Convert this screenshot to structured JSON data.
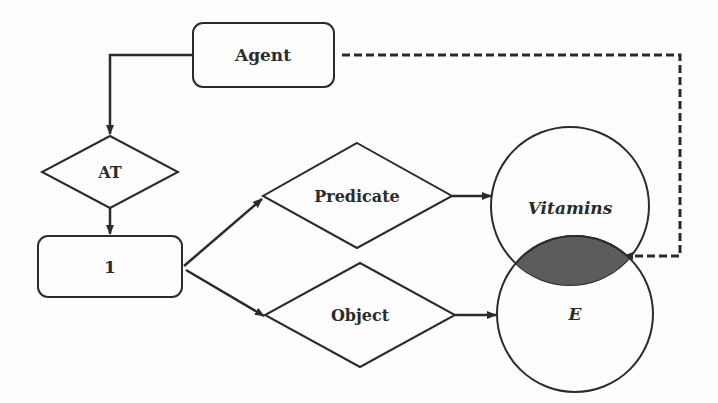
{
  "diagram": {
    "nodes": {
      "agent": {
        "label": "Agent",
        "shape": "rounded-rect"
      },
      "at": {
        "label": "AT",
        "shape": "diamond"
      },
      "one": {
        "label": "1",
        "shape": "rounded-rect"
      },
      "predicate": {
        "label": "Predicate",
        "shape": "diamond"
      },
      "object": {
        "label": "Object",
        "shape": "diamond"
      },
      "vitamins": {
        "label": "Vitamins",
        "shape": "circle"
      },
      "e": {
        "label": "E",
        "shape": "circle"
      }
    },
    "edges": [
      {
        "from": "Agent",
        "to": "AT",
        "style": "solid"
      },
      {
        "from": "AT",
        "to": "1",
        "style": "solid"
      },
      {
        "from": "1",
        "to": "Predicate",
        "style": "solid"
      },
      {
        "from": "1",
        "to": "Object",
        "style": "solid"
      },
      {
        "from": "Predicate",
        "to": "Vitamins",
        "style": "solid"
      },
      {
        "from": "Object",
        "to": "E",
        "style": "solid"
      },
      {
        "from": "Agent",
        "to": "Vitamins ∩ E",
        "style": "dashed"
      }
    ],
    "colors": {
      "stroke": "#2b2b2b",
      "intersection_fill": "#5c5c5c",
      "background": "#fdfdfd"
    }
  }
}
